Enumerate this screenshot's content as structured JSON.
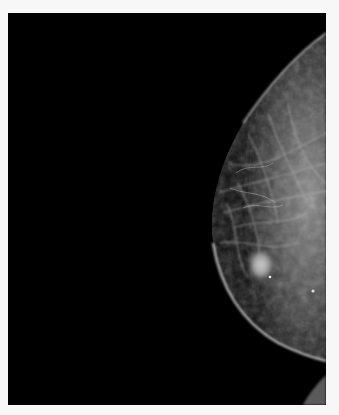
{
  "image": {
    "type": "mammogram",
    "view": "breast tissue, right-side profile against black background",
    "background_color": "#f7f7f7",
    "image_bg_color": "#000000",
    "tissue_color": "#9a9a9a",
    "features": [
      "fibroglandular tissue strands",
      "bright oval mass lower-center",
      "skin line edge",
      "small calcification"
    ]
  }
}
